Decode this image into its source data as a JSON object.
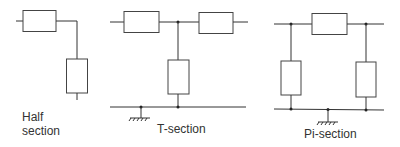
{
  "diagram": {
    "background": "#ffffff",
    "line_color": "#333333",
    "sections": [
      {
        "id": "half",
        "label_line1": "Half",
        "label_line2": "section",
        "series_elements": 1,
        "shunt_elements": 1
      },
      {
        "id": "t",
        "label": "T-section",
        "series_elements": 2,
        "shunt_elements": 1,
        "ground_symbol": true
      },
      {
        "id": "pi",
        "label": "Pi-section",
        "series_elements": 1,
        "shunt_elements": 2,
        "ground_symbol": true
      }
    ]
  }
}
